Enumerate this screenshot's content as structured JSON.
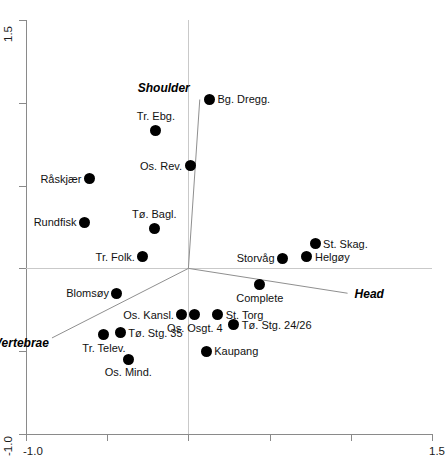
{
  "chart_data": {
    "type": "scatter",
    "title": "",
    "xlabel": "",
    "ylabel": "",
    "xlim": [
      -1.0,
      1.5
    ],
    "ylim": [
      -1.0,
      1.5
    ],
    "grid": false,
    "legend": "none",
    "x_ticks": [
      {
        "value": -1.0,
        "label": "-1.0"
      },
      {
        "value": -0.5,
        "label": ""
      },
      {
        "value": 0.0,
        "label": ""
      },
      {
        "value": 0.5,
        "label": ""
      },
      {
        "value": 1.0,
        "label": ""
      },
      {
        "value": 1.5,
        "label": "1.5"
      }
    ],
    "y_ticks": [
      {
        "value": 1.5,
        "label": "1.5"
      },
      {
        "value": 1.0,
        "label": ""
      },
      {
        "value": 0.5,
        "label": ""
      },
      {
        "value": 0.0,
        "label": ""
      },
      {
        "value": -0.5,
        "label": ""
      },
      {
        "value": -1.0,
        "label": "-1.0"
      }
    ],
    "zero_lines": {
      "x": 0.0,
      "y": 0.0
    },
    "vectors": [
      {
        "name": "Shoulder",
        "x": 0.07,
        "y": 1.02,
        "label": "Shoulder",
        "label_pos": "above-left"
      },
      {
        "name": "Head",
        "x": 0.98,
        "y": -0.15,
        "label": "Head",
        "label_pos": "right"
      },
      {
        "name": "Vertebrae",
        "x": -0.84,
        "y": -0.42,
        "label": "Vertebrae",
        "label_pos": "below-left"
      }
    ],
    "points": [
      {
        "label": "Bg. Dregg.",
        "x": 0.13,
        "y": 1.02,
        "label_pos": "right"
      },
      {
        "label": "Tr. Ebg.",
        "x": -0.2,
        "y": 0.83,
        "label_pos": "above"
      },
      {
        "label": "Os. Rev.",
        "x": 0.01,
        "y": 0.62,
        "label_pos": "left"
      },
      {
        "label": "Råskjær",
        "x": -0.61,
        "y": 0.54,
        "label_pos": "left"
      },
      {
        "label": "Rundfisk",
        "x": -0.64,
        "y": 0.28,
        "label_pos": "left"
      },
      {
        "label": "Tø. Bagl.",
        "x": -0.21,
        "y": 0.24,
        "label_pos": "above"
      },
      {
        "label": "Tr. Folk.",
        "x": -0.28,
        "y": 0.07,
        "label_pos": "left"
      },
      {
        "label": "St. Skag.",
        "x": 0.78,
        "y": 0.15,
        "label_pos": "right"
      },
      {
        "label": "Helgøy",
        "x": 0.73,
        "y": 0.07,
        "label_pos": "right"
      },
      {
        "label": "Storvåg",
        "x": 0.58,
        "y": 0.06,
        "label_pos": "left"
      },
      {
        "label": "Complete",
        "x": 0.44,
        "y": -0.1,
        "label_pos": "below"
      },
      {
        "label": "Blomsøy",
        "x": -0.44,
        "y": -0.15,
        "label_pos": "left"
      },
      {
        "label": "Os. Kansl.",
        "x": -0.04,
        "y": -0.28,
        "label_pos": "left"
      },
      {
        "label": "Os. Osgt. 4",
        "x": 0.04,
        "y": -0.28,
        "label_pos": "below"
      },
      {
        "label": "St. Torg",
        "x": 0.18,
        "y": -0.28,
        "label_pos": "right"
      },
      {
        "label": "Tø. Stg. 24/26",
        "x": 0.28,
        "y": -0.34,
        "label_pos": "right"
      },
      {
        "label": "Tø. Stg. 35",
        "x": -0.42,
        "y": -0.39,
        "label_pos": "right"
      },
      {
        "label": "Tr. Telev.",
        "x": -0.52,
        "y": -0.4,
        "label_pos": "below"
      },
      {
        "label": "Kaupang",
        "x": 0.11,
        "y": -0.5,
        "label_pos": "right"
      },
      {
        "label": "Os. Mind.",
        "x": -0.37,
        "y": -0.55,
        "label_pos": "below"
      }
    ]
  }
}
